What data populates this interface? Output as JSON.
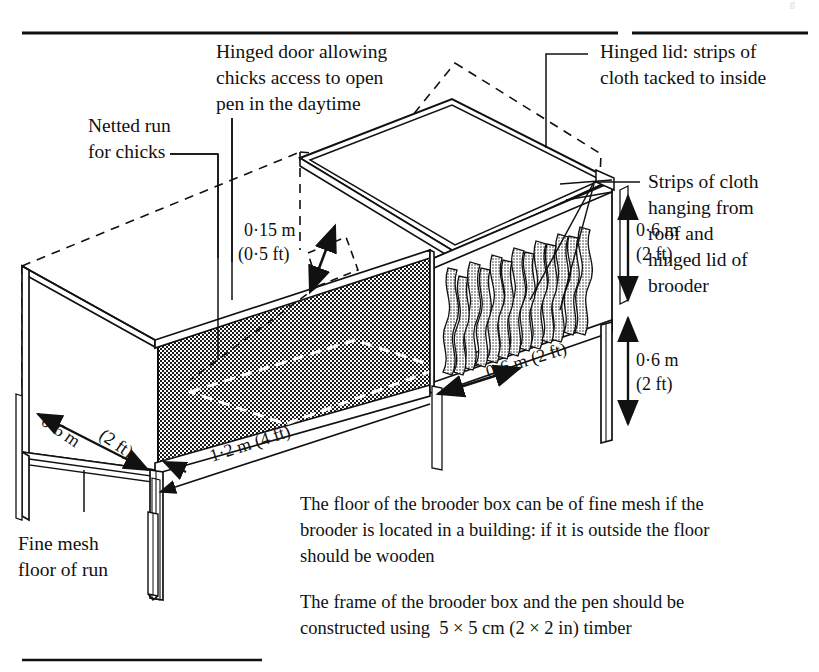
{
  "page": {
    "header_faint": "g",
    "background": "#ffffff",
    "ink": "#111111"
  },
  "labels": {
    "hinged_door": [
      "Hinged door allowing",
      "chicks access to open",
      "pen in the daytime"
    ],
    "hinged_lid": [
      "Hinged lid: strips of",
      "cloth tacked to inside"
    ],
    "netted_run": [
      "Netted run",
      "for chicks"
    ],
    "strips_of_cloth": [
      "Strips of cloth",
      "hanging from",
      "roof and",
      "hinged lid of",
      "brooder"
    ],
    "fine_mesh_floor": [
      "Fine mesh",
      "floor of run"
    ]
  },
  "dimensions": {
    "door_height": [
      "0·15 m",
      "(0·5 ft)"
    ],
    "brooder_height": [
      "0·6 m",
      "(2 ft)"
    ],
    "leg_height": [
      "0·6 m",
      "(2 ft)"
    ],
    "brooder_depth": "0·6 m (2 ft)",
    "run_depth_a": "0·6 m",
    "run_depth_b": "(2 ft)",
    "run_length": "1·2 m (4 ft)"
  },
  "notes": {
    "floor_note": [
      "The floor of the brooder box can be of fine mesh if the",
      "brooder is located in a building: if it is outside the floor",
      "should be wooden"
    ],
    "frame_note": [
      "The frame of the brooder box and the pen should be",
      "constructed using  5 × 5 cm (2 × 2 in) timber"
    ]
  }
}
